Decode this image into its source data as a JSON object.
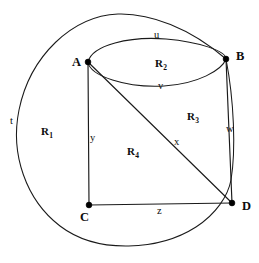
{
  "figure": {
    "type": "topological-graph-diagram",
    "stroke_color": "#1a1a1a",
    "vertex_color": "#000000",
    "background_color": "#ffffff"
  },
  "vertices": [
    {
      "id": "A",
      "label": "A",
      "cx": 88,
      "cy": 62,
      "label_x": 72,
      "label_y": 56
    },
    {
      "id": "B",
      "label": "B",
      "cx": 226,
      "cy": 59,
      "label_x": 236,
      "label_y": 50
    },
    {
      "id": "C",
      "label": "C",
      "cx": 89,
      "cy": 205,
      "label_x": 80,
      "label_y": 211
    },
    {
      "id": "D",
      "label": "D",
      "cx": 232,
      "cy": 203,
      "label_x": 242,
      "label_y": 200
    }
  ],
  "edges": [
    {
      "id": "u",
      "label": "u",
      "between": "A-B",
      "shape": "arc-upper",
      "label_x": 154,
      "label_y": 30
    },
    {
      "id": "v",
      "label": "v",
      "between": "A-B",
      "shape": "arc-lower",
      "label_x": 158,
      "label_y": 81
    },
    {
      "id": "t",
      "label": "t",
      "between": "B-D",
      "shape": "outer-circle",
      "label_x": 10,
      "label_y": 116
    },
    {
      "id": "w",
      "label": "w",
      "between": "B-D",
      "shape": "straight",
      "label_x": 226,
      "label_y": 124
    },
    {
      "id": "x",
      "label": "x",
      "between": "A-D",
      "shape": "straight",
      "label_x": 174,
      "label_y": 137
    },
    {
      "id": "y",
      "label": "y",
      "between": "A-C",
      "shape": "straight",
      "label_x": 90,
      "label_y": 133
    },
    {
      "id": "z",
      "label": "z",
      "between": "C-D",
      "shape": "straight",
      "label_x": 157,
      "label_y": 206
    }
  ],
  "regions": [
    {
      "id": "R1",
      "label": "R",
      "sub": "1",
      "label_x": 41,
      "label_y": 126
    },
    {
      "id": "R2",
      "label": "R",
      "sub": "2",
      "label_x": 155,
      "label_y": 58
    },
    {
      "id": "R3",
      "label": "R",
      "sub": "3",
      "label_x": 187,
      "label_y": 111
    },
    {
      "id": "R4",
      "label": "R",
      "sub": "4",
      "label_x": 127,
      "label_y": 146
    }
  ],
  "geometry": {
    "outer_circle": {
      "cx": 128,
      "cy": 130,
      "rx": 110,
      "ry": 116
    },
    "inner_ellipse": {
      "cx": 157,
      "cy": 73,
      "rx": 70,
      "ry": 20
    }
  }
}
